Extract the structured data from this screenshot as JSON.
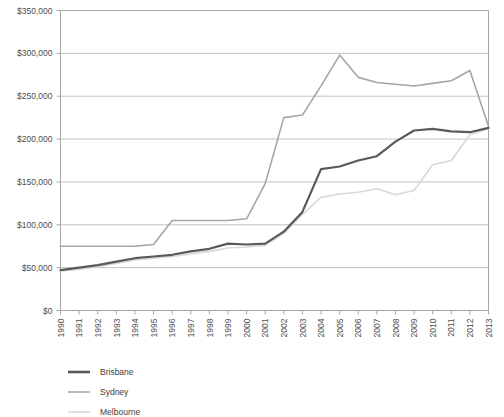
{
  "chart_data": {
    "type": "line",
    "title": "",
    "subtitle": "",
    "xlabel": "",
    "ylabel": "",
    "grid": true,
    "legend_position": "bottom-left",
    "ylim": [
      0,
      350000
    ],
    "ytick_step": 50000,
    "ytick_labels": [
      "$0",
      "$50,000",
      "$100,000",
      "$150,000",
      "$200,000",
      "$250,000",
      "$300,000",
      "$350,000"
    ],
    "ytick_values": [
      0,
      50000,
      100000,
      150000,
      200000,
      250000,
      300000,
      350000
    ],
    "categories": [
      "1990",
      "1991",
      "1992",
      "1993",
      "1994",
      "1995",
      "1996",
      "1997",
      "1998",
      "1999",
      "2000",
      "2001",
      "2002",
      "2003",
      "2004",
      "2005",
      "2006",
      "2007",
      "2008",
      "2009",
      "2010",
      "2011",
      "2012",
      "2013"
    ],
    "series": [
      {
        "name": "Brisbane",
        "color": "#595959",
        "width": 2.2,
        "values": [
          47000,
          50000,
          53000,
          57000,
          61000,
          63000,
          65000,
          69000,
          72000,
          78000,
          77000,
          78000,
          92000,
          115000,
          165000,
          168000,
          175000,
          180000,
          197000,
          210000,
          212000,
          209000,
          208000,
          213000
        ]
      },
      {
        "name": "Sydney",
        "color": "#a6a6a6",
        "width": 1.6,
        "values": [
          75000,
          75000,
          75000,
          75000,
          75000,
          77000,
          105000,
          105000,
          105000,
          105000,
          107000,
          148000,
          225000,
          228000,
          262000,
          298000,
          272000,
          266000,
          264000,
          262000,
          265000,
          268000,
          280000,
          215000
        ]
      },
      {
        "name": "Melbourne",
        "color": "#d9d9d9",
        "width": 1.6,
        "values": [
          46000,
          48000,
          51000,
          55000,
          59000,
          61000,
          63000,
          66000,
          69000,
          73000,
          74000,
          76000,
          90000,
          112000,
          132000,
          136000,
          138000,
          142000,
          135000,
          140000,
          170000,
          175000,
          205000,
          212000
        ]
      }
    ]
  },
  "legend": {
    "items": [
      {
        "label": "Brisbane",
        "color": "#595959",
        "width": 2.6
      },
      {
        "label": "Sydney",
        "color": "#a6a6a6",
        "width": 1.6
      },
      {
        "label": "Melbourne",
        "color": "#d9d9d9",
        "width": 1.6
      }
    ]
  }
}
